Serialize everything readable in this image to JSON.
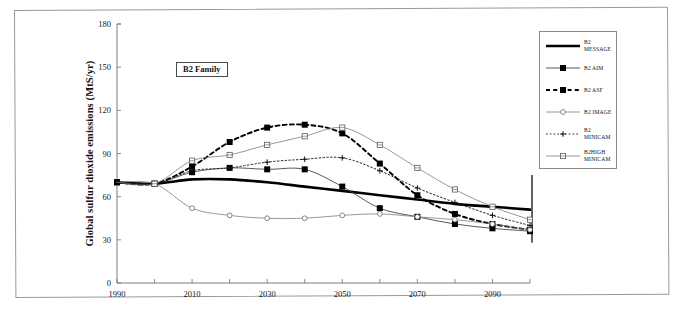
{
  "figure": {
    "annotation": "B2 Family",
    "ylabel": "Global sulfur dioxide emissions (MtS/yr)"
  },
  "legend": {
    "items": [
      {
        "label": "B2 MESSAGE",
        "style": "thick-solid",
        "marker": "none",
        "color": "#000000"
      },
      {
        "label": "B2 AIM",
        "style": "solid",
        "marker": "filled-square",
        "color": "#000000"
      },
      {
        "label": "B2 ASF",
        "style": "dashed",
        "marker": "filled-square",
        "color": "#000000"
      },
      {
        "label": "B2 IMAGE",
        "style": "thin-solid",
        "marker": "open-circle",
        "color": "#555555"
      },
      {
        "label": "B2 MINICAM",
        "style": "dotted",
        "marker": "plus",
        "color": "#333333"
      },
      {
        "label": "B2HIGH\nMINICAM",
        "style": "thin-solid",
        "marker": "open-square",
        "color": "#555555"
      }
    ]
  },
  "chart_data": {
    "type": "line",
    "title": "",
    "xlabel": "",
    "ylabel": "Global sulfur dioxide emissions (MtS/yr)",
    "xlim": [
      1990,
      2100
    ],
    "ylim": [
      0,
      180
    ],
    "yticks": [
      0,
      30,
      60,
      90,
      120,
      150,
      180
    ],
    "xticks": [
      1990,
      2010,
      2030,
      2050,
      2070,
      2090
    ],
    "xticks_minor": [
      2000,
      2020,
      2040,
      2060,
      2080,
      2100
    ],
    "grid": false,
    "legend_position": "right-outside",
    "annotation": "B2 Family",
    "x": [
      1990,
      2000,
      2010,
      2020,
      2030,
      2040,
      2050,
      2060,
      2070,
      2080,
      2090,
      2100
    ],
    "series": [
      {
        "name": "B2 MESSAGE",
        "values": [
          70,
          69,
          72,
          72,
          70,
          67,
          64,
          61,
          58,
          55,
          53,
          51
        ]
      },
      {
        "name": "B2 AIM",
        "values": [
          70,
          69,
          77,
          80,
          79,
          79,
          67,
          52,
          46,
          41,
          38,
          36
        ]
      },
      {
        "name": "B2 ASF",
        "values": [
          70,
          69,
          81,
          98,
          108,
          110,
          104,
          83,
          61,
          48,
          41,
          37
        ]
      },
      {
        "name": "B2 IMAGE",
        "values": [
          70,
          69,
          52,
          47,
          45,
          45,
          47,
          48,
          46,
          44,
          41,
          37
        ]
      },
      {
        "name": "B2 MINICAM",
        "values": [
          70,
          69,
          78,
          80,
          84,
          86,
          87,
          78,
          66,
          56,
          47,
          40
        ]
      },
      {
        "name": "B2HIGH MINICAM",
        "values": [
          70,
          69,
          85,
          89,
          96,
          102,
          108,
          96,
          80,
          65,
          53,
          44
        ]
      }
    ]
  }
}
